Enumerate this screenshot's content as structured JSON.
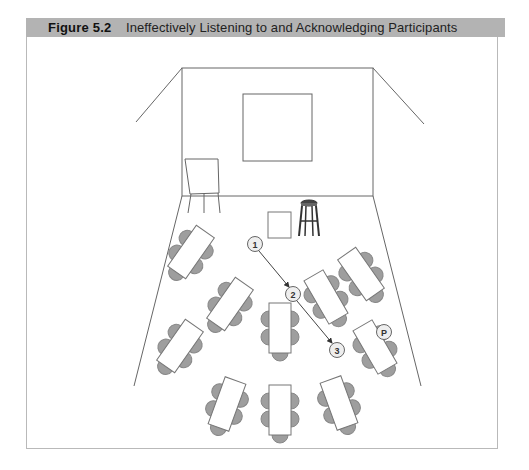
{
  "figure": {
    "number": "Figure 5.2",
    "title": "Ineffectively Listening to and Acknowledging Participants"
  },
  "colors": {
    "header_bg": "#b3b3b3",
    "line": "#666666",
    "chair": "#9e9e9e",
    "marker_fill": "#eeeeee"
  },
  "room": {
    "objects": [
      "back-wall",
      "screen",
      "flipchart-easel",
      "paper",
      "stool"
    ]
  },
  "markers": [
    {
      "id": "m1",
      "label": "1"
    },
    {
      "id": "m2",
      "label": "2"
    },
    {
      "id": "m3",
      "label": "3"
    },
    {
      "id": "p",
      "label": "P"
    }
  ],
  "path": [
    "1",
    "2",
    "3"
  ],
  "tables": {
    "count": 10,
    "chairs_per_table": 5
  }
}
